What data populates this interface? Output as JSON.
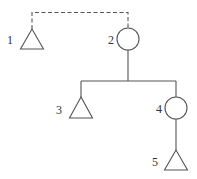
{
  "diagram": {
    "type": "pedigree",
    "colors": {
      "stroke": "#555555",
      "text": "#333333",
      "background": "#ffffff"
    },
    "nodes": [
      {
        "id": "1",
        "label": "1",
        "shape": "triangle",
        "cx": 32,
        "cy": 40
      },
      {
        "id": "2",
        "label": "2",
        "shape": "circle",
        "cx": 128,
        "cy": 39
      },
      {
        "id": "3",
        "label": "3",
        "shape": "triangle",
        "cx": 81,
        "cy": 108
      },
      {
        "id": "4",
        "label": "4",
        "shape": "circle",
        "cx": 176,
        "cy": 108
      },
      {
        "id": "5",
        "label": "5",
        "shape": "triangle",
        "cx": 176,
        "cy": 161
      }
    ],
    "edges": [
      {
        "from": "1",
        "to": "2",
        "style": "dashed",
        "kind": "partnership"
      },
      {
        "from": "2",
        "to": "3",
        "style": "solid",
        "kind": "descent"
      },
      {
        "from": "2",
        "to": "4",
        "style": "solid",
        "kind": "descent"
      },
      {
        "from": "4",
        "to": "5",
        "style": "solid",
        "kind": "descent"
      }
    ]
  }
}
